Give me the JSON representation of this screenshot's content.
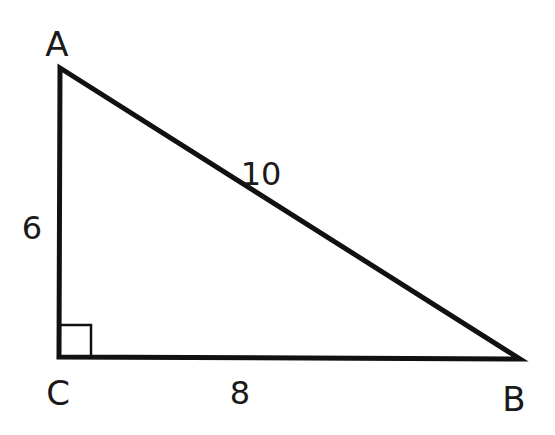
{
  "diagram": {
    "vertices": [
      {
        "name": "A",
        "x": 60,
        "y": 68,
        "label_x": 57,
        "label_y": 56
      },
      {
        "name": "C",
        "x": 59,
        "y": 357,
        "label_x": 58,
        "label_y": 405
      },
      {
        "name": "B",
        "x": 520,
        "y": 359,
        "label_x": 514,
        "label_y": 411
      }
    ],
    "sides": [
      {
        "name": "AC",
        "length_label": "6",
        "label_x": 32,
        "label_y": 239
      },
      {
        "name": "CB",
        "length_label": "8",
        "label_x": 240,
        "label_y": 404
      },
      {
        "name": "AB",
        "length_label": "10",
        "label_x": 261,
        "label_y": 185
      }
    ],
    "right_angle_at": "C",
    "right_angle_marker_size": 32,
    "stroke_color": "#111111",
    "label_color": "#1a1a1a"
  }
}
